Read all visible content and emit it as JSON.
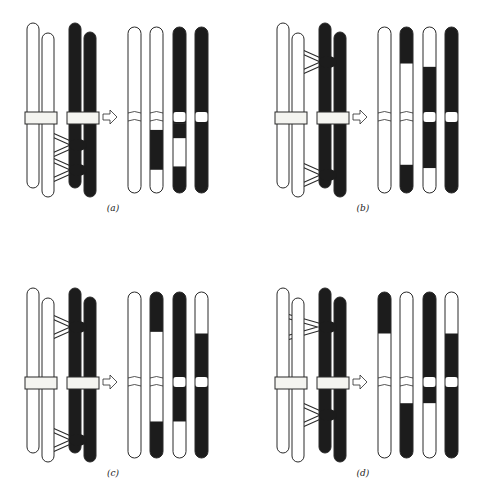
{
  "figure": {
    "colors": {
      "light": "#ffffff",
      "dark": "#1c1c1c",
      "outline": "#2a2a2a",
      "centromere_band": "#f4f4f0"
    },
    "panels": [
      {
        "id": "a",
        "label": "(a)",
        "origin": [
          0,
          0
        ],
        "crossovers": [
          {
            "y": 145,
            "from": "white-2",
            "to": "dark-1"
          },
          {
            "y": 170,
            "from": "white-2",
            "to": "dark-1"
          }
        ],
        "results": [
          {
            "segments": [
              [
                "w",
                0,
                1
              ]
            ]
          },
          {
            "segments": [
              [
                "w",
                0,
                0.62
              ],
              [
                "d",
                0.62,
                0.86
              ],
              [
                "w",
                0.86,
                1
              ]
            ]
          },
          {
            "segments": [
              [
                "d",
                0,
                0.58
              ],
              [
                "d",
                0.58,
                0.67
              ],
              [
                "w",
                0.67,
                0.84
              ],
              [
                "d",
                0.84,
                1
              ]
            ],
            "band": true
          },
          {
            "segments": [
              [
                "d",
                0,
                1
              ]
            ],
            "band": true
          }
        ]
      },
      {
        "id": "b",
        "label": "(b)",
        "origin": [
          250,
          0
        ],
        "crossovers": [
          {
            "y": 62,
            "from": "white-2",
            "to": "dark-1"
          },
          {
            "y": 175,
            "from": "white-2",
            "to": "dark-1"
          }
        ],
        "results": [
          {
            "segments": [
              [
                "w",
                0,
                1
              ]
            ]
          },
          {
            "segments": [
              [
                "d",
                0,
                0.22
              ],
              [
                "w",
                0.22,
                0.83
              ],
              [
                "d",
                0.83,
                1
              ]
            ]
          },
          {
            "segments": [
              [
                "w",
                0,
                0.24
              ],
              [
                "d",
                0.24,
                0.85
              ],
              [
                "w",
                0.85,
                1
              ]
            ],
            "band": true
          },
          {
            "segments": [
              [
                "d",
                0,
                1
              ]
            ],
            "band": true
          }
        ]
      },
      {
        "id": "c",
        "label": "(c)",
        "origin": [
          0,
          265
        ],
        "crossovers": [
          {
            "y": 62,
            "from": "white-2",
            "to": "dark-1"
          },
          {
            "y": 175,
            "from": "white-2",
            "to": "dark-1"
          }
        ],
        "results": [
          {
            "segments": [
              [
                "w",
                0,
                1
              ]
            ]
          },
          {
            "segments": [
              [
                "d",
                0,
                0.24
              ],
              [
                "w",
                0.24,
                0.78
              ],
              [
                "d",
                0.78,
                1
              ]
            ]
          },
          {
            "segments": [
              [
                "d",
                0,
                0.78
              ],
              [
                "w",
                0.78,
                1
              ]
            ],
            "band": true
          },
          {
            "segments": [
              [
                "w",
                0,
                0.25
              ],
              [
                "d",
                0.25,
                1
              ]
            ],
            "band": true
          }
        ]
      },
      {
        "id": "d",
        "label": "(d)",
        "origin": [
          250,
          265
        ],
        "crossovers": [
          {
            "y": 62,
            "from": "white-1",
            "to": "dark-1"
          },
          {
            "y": 150,
            "from": "white-2",
            "to": "dark-1"
          }
        ],
        "results": [
          {
            "segments": [
              [
                "d",
                0,
                0.25
              ],
              [
                "w",
                0.25,
                1
              ]
            ]
          },
          {
            "segments": [
              [
                "w",
                0,
                0.67
              ],
              [
                "d",
                0.67,
                1
              ]
            ]
          },
          {
            "segments": [
              [
                "d",
                0,
                0.67
              ],
              [
                "w",
                0.67,
                1
              ]
            ],
            "band": true
          },
          {
            "segments": [
              [
                "w",
                0,
                0.25
              ],
              [
                "d",
                0.25,
                1
              ]
            ],
            "band": true
          }
        ]
      }
    ]
  }
}
